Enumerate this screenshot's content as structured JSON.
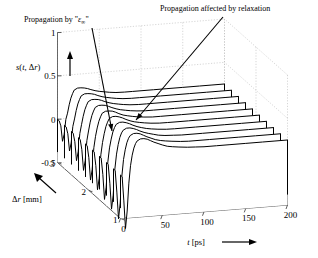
{
  "figure": {
    "type": "3d-waterfall-plot",
    "background": "#ffffff",
    "line_color": "#000000",
    "grid_color": "#bbbbbb"
  },
  "annotations": [
    {
      "id": "anno-eps-inf",
      "text": "Propagation by \"ε∞\"",
      "text_x": 24,
      "text_y": 22,
      "arrow_from_x": 92,
      "arrow_from_y": 28,
      "arrow_to_x": 112,
      "arrow_to_y": 131
    },
    {
      "id": "anno-relaxation",
      "text": "Propagation affected by relaxation",
      "text_x": 160,
      "text_y": 11,
      "arrow_from_x": 223,
      "arrow_from_y": 17,
      "arrow_to_x": 136,
      "arrow_to_y": 120
    }
  ],
  "chart_data": {
    "type": "line",
    "title": "",
    "subtitle": "",
    "xlabel": "t [ps]",
    "ylabel": "s(t, Δr)",
    "zlabel": "Δr [mm]",
    "xlim": [
      0,
      200
    ],
    "ylim": [
      -0.5,
      1
    ],
    "zlim": [
      1,
      3
    ],
    "grid": true,
    "legend": "none",
    "x_ticks": [
      0,
      50,
      100,
      150,
      200
    ],
    "x_tick_labels": [
      "0",
      "50",
      "100",
      "150",
      "200"
    ],
    "y_ticks": [
      -0.5,
      0,
      0.5,
      1
    ],
    "y_tick_labels": [
      "-0.5",
      "0",
      "0.5",
      "1"
    ],
    "z_ticks": [
      1,
      2,
      3
    ],
    "z_tick_labels": [
      "1",
      "2",
      "3"
    ],
    "x_arrow": true,
    "y_arrow": true,
    "z_arrow": true,
    "n_traces": 10,
    "trace_z_values": [
      1.0,
      1.222,
      1.444,
      1.667,
      1.889,
      2.111,
      2.333,
      2.556,
      2.778,
      3.0
    ],
    "x": [
      0,
      2,
      4,
      6,
      8,
      10,
      12,
      14,
      16,
      18,
      20,
      24,
      28,
      32,
      36,
      40,
      45,
      50,
      56,
      62,
      70,
      80,
      90,
      100,
      115,
      130,
      150,
      170,
      185,
      200
    ],
    "series": [
      {
        "name": "dr=1.000",
        "values": [
          0.0,
          -0.02,
          -0.3,
          -0.62,
          -0.42,
          -0.1,
          0.1,
          0.22,
          0.3,
          0.35,
          0.38,
          0.4,
          0.4,
          0.39,
          0.37,
          0.35,
          0.33,
          0.31,
          0.29,
          0.28,
          0.27,
          0.26,
          0.255,
          0.25,
          0.25,
          0.25,
          0.25,
          0.25,
          0.25,
          0.25
        ]
      },
      {
        "name": "dr=1.222",
        "values": [
          0.0,
          -0.02,
          -0.27,
          -0.58,
          -0.4,
          -0.09,
          0.1,
          0.21,
          0.29,
          0.34,
          0.37,
          0.39,
          0.39,
          0.38,
          0.36,
          0.34,
          0.32,
          0.3,
          0.285,
          0.275,
          0.265,
          0.255,
          0.25,
          0.25,
          0.25,
          0.25,
          0.25,
          0.25,
          0.25,
          0.25
        ]
      },
      {
        "name": "dr=1.444",
        "values": [
          0.0,
          -0.02,
          -0.24,
          -0.54,
          -0.38,
          -0.08,
          0.09,
          0.2,
          0.28,
          0.33,
          0.36,
          0.38,
          0.38,
          0.37,
          0.355,
          0.335,
          0.315,
          0.3,
          0.285,
          0.27,
          0.26,
          0.255,
          0.25,
          0.25,
          0.25,
          0.25,
          0.25,
          0.25,
          0.25,
          0.25
        ]
      },
      {
        "name": "dr=1.667",
        "values": [
          0.0,
          -0.02,
          -0.21,
          -0.5,
          -0.36,
          -0.07,
          0.09,
          0.19,
          0.27,
          0.32,
          0.355,
          0.375,
          0.375,
          0.365,
          0.35,
          0.33,
          0.31,
          0.295,
          0.28,
          0.27,
          0.26,
          0.252,
          0.25,
          0.25,
          0.25,
          0.25,
          0.25,
          0.25,
          0.25,
          0.25
        ]
      },
      {
        "name": "dr=1.889",
        "values": [
          0.0,
          -0.02,
          -0.18,
          -0.46,
          -0.33,
          -0.06,
          0.08,
          0.18,
          0.26,
          0.31,
          0.35,
          0.37,
          0.37,
          0.36,
          0.345,
          0.325,
          0.305,
          0.29,
          0.278,
          0.268,
          0.258,
          0.251,
          0.25,
          0.25,
          0.25,
          0.25,
          0.25,
          0.25,
          0.25,
          0.25
        ]
      },
      {
        "name": "dr=2.111",
        "values": [
          0.0,
          -0.02,
          -0.16,
          -0.42,
          -0.3,
          -0.05,
          0.08,
          0.175,
          0.25,
          0.3,
          0.34,
          0.36,
          0.36,
          0.355,
          0.34,
          0.32,
          0.3,
          0.288,
          0.276,
          0.266,
          0.257,
          0.25,
          0.25,
          0.25,
          0.25,
          0.25,
          0.25,
          0.25,
          0.25,
          0.25
        ]
      },
      {
        "name": "dr=2.333",
        "values": [
          0.0,
          -0.02,
          -0.14,
          -0.38,
          -0.27,
          -0.04,
          0.07,
          0.17,
          0.245,
          0.295,
          0.335,
          0.355,
          0.355,
          0.35,
          0.335,
          0.318,
          0.3,
          0.286,
          0.275,
          0.265,
          0.256,
          0.25,
          0.25,
          0.25,
          0.25,
          0.25,
          0.25,
          0.25,
          0.25,
          0.25
        ]
      },
      {
        "name": "dr=2.556",
        "values": [
          0.0,
          -0.02,
          -0.12,
          -0.34,
          -0.24,
          -0.03,
          0.07,
          0.165,
          0.24,
          0.29,
          0.33,
          0.35,
          0.35,
          0.345,
          0.332,
          0.315,
          0.298,
          0.285,
          0.274,
          0.264,
          0.255,
          0.25,
          0.25,
          0.25,
          0.25,
          0.25,
          0.25,
          0.25,
          0.25,
          0.25
        ]
      },
      {
        "name": "dr=2.778",
        "values": [
          0.0,
          -0.02,
          -0.1,
          -0.3,
          -0.21,
          -0.02,
          0.065,
          0.16,
          0.235,
          0.285,
          0.325,
          0.345,
          0.345,
          0.34,
          0.33,
          0.313,
          0.296,
          0.284,
          0.273,
          0.263,
          0.254,
          0.25,
          0.25,
          0.25,
          0.25,
          0.25,
          0.25,
          0.25,
          0.25,
          0.25
        ]
      },
      {
        "name": "dr=3.000",
        "values": [
          0.0,
          -0.02,
          -0.08,
          -0.26,
          -0.18,
          -0.01,
          0.06,
          0.155,
          0.23,
          0.28,
          0.32,
          0.34,
          0.34,
          0.335,
          0.325,
          0.31,
          0.294,
          0.282,
          0.272,
          0.262,
          0.253,
          0.25,
          0.25,
          0.25,
          0.25,
          0.25,
          0.25,
          0.25,
          0.25,
          0.25
        ]
      }
    ]
  }
}
